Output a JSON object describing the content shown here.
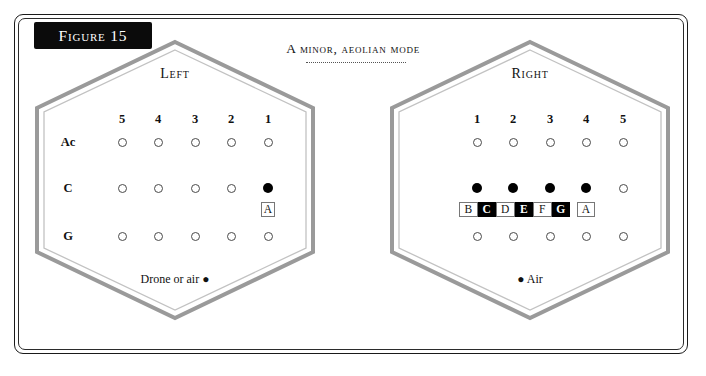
{
  "figure": {
    "banner_label": "Figure 15",
    "mode_title": "A minor, aeolian mode"
  },
  "panels": [
    {
      "id": "left",
      "side_label": "Left",
      "columns": [
        "5",
        "4",
        "3",
        "2",
        "1"
      ],
      "rows": [
        "Ac",
        "C",
        "G"
      ],
      "dots": [
        [
          "open",
          "open",
          "open",
          "open",
          "open"
        ],
        [
          "open",
          "open",
          "open",
          "open",
          "filled"
        ],
        [
          "open",
          "open",
          "open",
          "open",
          "open"
        ]
      ],
      "notes": [
        {
          "label": "A",
          "style": "light",
          "column": 5
        }
      ],
      "footer_text": "Drone or air",
      "footer_bullet": "●",
      "footer_bullet_first": false
    },
    {
      "id": "right",
      "side_label": "Right",
      "columns": [
        "1",
        "2",
        "3",
        "4",
        "5"
      ],
      "rows": [
        "",
        "",
        ""
      ],
      "dots": [
        [
          "open",
          "open",
          "open",
          "open",
          "open"
        ],
        [
          "filled",
          "filled",
          "filled",
          "filled",
          "open"
        ],
        [
          "open",
          "open",
          "open",
          "open",
          "open"
        ]
      ],
      "notes": [
        {
          "label": "B",
          "style": "light"
        },
        {
          "label": "C",
          "style": "dark"
        },
        {
          "label": "D",
          "style": "light"
        },
        {
          "label": "E",
          "style": "dark"
        },
        {
          "label": "F",
          "style": "light"
        },
        {
          "label": "G",
          "style": "dark"
        },
        {
          "label": "A",
          "style": "light"
        }
      ],
      "footer_text": "Air",
      "footer_bullet": "●",
      "footer_bullet_first": true
    }
  ],
  "colors": {
    "frame": "#1a1a1a",
    "hex_outer": "#9a9a9a",
    "hex_inner": "#bdbdbd",
    "banner_bg": "#0b0b0b",
    "dot_open": "#4a4a4a",
    "dot_filled": "#000000"
  }
}
